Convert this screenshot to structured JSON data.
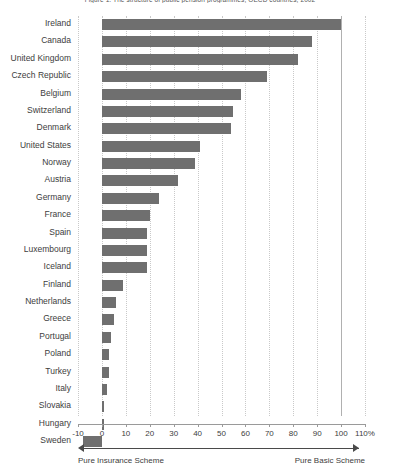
{
  "chart_data": {
    "type": "bar",
    "orientation": "horizontal",
    "title": "Figure 1.  The structure of public pension programmes, OECD countries, 2002",
    "xlabel": "",
    "ylabel": "",
    "xlim": [
      -10,
      110
    ],
    "xticks": [
      -10,
      0,
      10,
      20,
      30,
      40,
      50,
      60,
      70,
      80,
      90,
      100,
      110
    ],
    "xticklabels": [
      "-10",
      "0",
      "10",
      "20",
      "30",
      "40",
      "50",
      "60",
      "70",
      "80",
      "90",
      "100",
      "110%"
    ],
    "grid": "vertical-dotted",
    "legend": "none",
    "bar_color": "#6f6f6f",
    "categories": [
      "Ireland",
      "Canada",
      "United Kingdom",
      "Czech Republic",
      "Belgium",
      "Switzerland",
      "Denmark",
      "United States",
      "Norway",
      "Austria",
      "Germany",
      "France",
      "Spain",
      "Luxembourg",
      "Iceland",
      "Finland",
      "Netherlands",
      "Greece",
      "Portugal",
      "Poland",
      "Turkey",
      "Italy",
      "Slovakia",
      "Hungary",
      "Sweden"
    ],
    "values": [
      100,
      88,
      82,
      69,
      58,
      55,
      54,
      41,
      39,
      32,
      24,
      20,
      19,
      19,
      19,
      9,
      6,
      5,
      4,
      3,
      3,
      2,
      1,
      1,
      -8
    ],
    "annotations": [
      {
        "text": "Pure Insurance Scheme",
        "position": "left"
      },
      {
        "text": "Pure Basic Scheme",
        "position": "right"
      }
    ]
  }
}
